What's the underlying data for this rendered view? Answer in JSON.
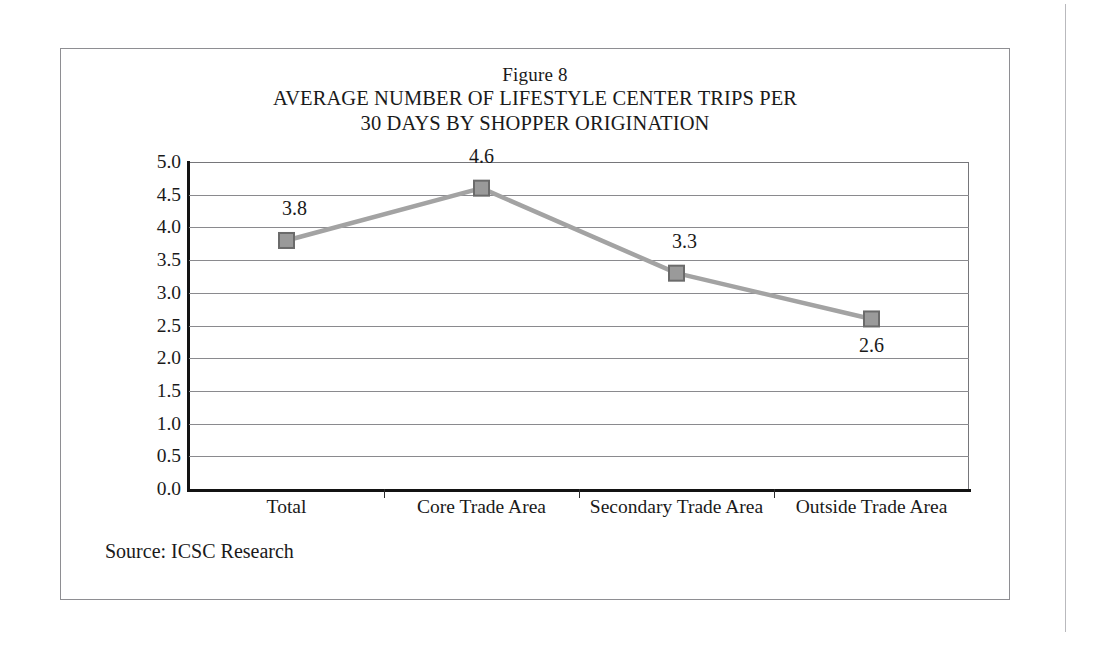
{
  "figure": {
    "title_line1": "Figure 8",
    "title_line2": "AVERAGE NUMBER OF LIFESTYLE CENTER TRIPS PER",
    "title_line3": "30 DAYS BY SHOPPER ORIGINATION",
    "source_note": "Source: ICSC Research"
  },
  "colors": {
    "series_line": "#a3a3a3",
    "marker_fill": "#9a9a9a",
    "marker_border": "#6b6b6b",
    "gridline": "#8a8a8e",
    "axis": "#131313",
    "frame": "#8e8e92",
    "text": "#1a1a1a"
  },
  "chart_data": {
    "type": "line",
    "title": "AVERAGE NUMBER OF LIFESTYLE CENTER TRIPS PER 30 DAYS BY SHOPPER ORIGINATION",
    "subtitle": "Figure 8",
    "xlabel": "",
    "ylabel": "",
    "categories": [
      "Total",
      "Core Trade Area",
      "Secondary Trade Area",
      "Outside Trade Area"
    ],
    "values": [
      3.8,
      4.6,
      3.3,
      2.6
    ],
    "point_labels": [
      "3.8",
      "4.6",
      "3.3",
      "2.6"
    ],
    "point_label_positions": [
      "above",
      "above",
      "above",
      "below"
    ],
    "ylim": [
      0.0,
      5.0
    ],
    "ytick_step": 0.5,
    "ytick_labels": [
      "5.0",
      "4.5",
      "4.0",
      "3.5",
      "3.0",
      "2.5",
      "2.0",
      "1.5",
      "1.0",
      "0.5",
      "0.0"
    ],
    "ytick_values": [
      5.0,
      4.5,
      4.0,
      3.5,
      3.0,
      2.5,
      2.0,
      1.5,
      1.0,
      0.5,
      0.0
    ],
    "grid": "horizontal",
    "legend": "none",
    "marker": "square"
  }
}
